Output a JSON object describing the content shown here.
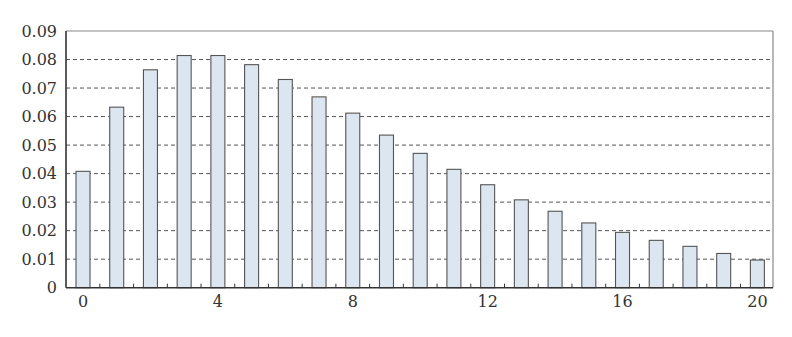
{
  "chart_data": {
    "type": "bar",
    "title": "",
    "xlabel": "",
    "ylabel": "",
    "categories": [
      0,
      1,
      2,
      3,
      4,
      5,
      6,
      7,
      8,
      9,
      10,
      11,
      12,
      13,
      14,
      15,
      16,
      17,
      18,
      19,
      20
    ],
    "values": [
      0.0408,
      0.0633,
      0.0764,
      0.0814,
      0.0814,
      0.0782,
      0.073,
      0.0669,
      0.0612,
      0.0535,
      0.0471,
      0.0415,
      0.0361,
      0.0308,
      0.0268,
      0.0227,
      0.0194,
      0.0166,
      0.0145,
      0.012,
      0.0097
    ],
    "ylim": [
      0,
      0.09
    ],
    "yticks": [
      "0",
      "0.01",
      "0.02",
      "0.03",
      "0.04",
      "0.05",
      "0.06",
      "0.07",
      "0.08",
      "0.09"
    ],
    "xticks_labeled": [
      "0",
      "4",
      "8",
      "12",
      "16",
      "20"
    ],
    "grid": "horizontal dashed",
    "legend": null,
    "colors": {
      "bar_fill": "#dbe6f1",
      "bar_stroke": "#555555",
      "grid": "#555555",
      "axis": "#333333",
      "frame": "#888888"
    }
  }
}
